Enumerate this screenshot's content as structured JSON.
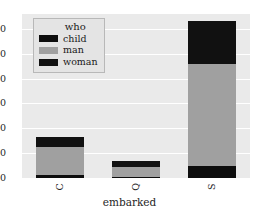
{
  "chart_data": {
    "type": "bar",
    "stacked": true,
    "title": "",
    "xlabel": "embarked",
    "ylabel": "",
    "categories": [
      "C",
      "Q",
      "S"
    ],
    "series": [
      {
        "name": "child",
        "color": "#0d0d0d",
        "values": [
          11,
          3,
          50
        ]
      },
      {
        "name": "man",
        "color": "#a0a0a0",
        "values": [
          115,
          40,
          410
        ]
      },
      {
        "name": "woman",
        "color": "#111111",
        "values": [
          38,
          25,
          170
        ]
      }
    ],
    "totals": [
      164,
      68,
      630
    ],
    "ylim": [
      0,
      660
    ],
    "yticks": [
      0,
      100,
      200,
      300,
      400,
      500,
      600
    ],
    "ytick_labels": [
      "0",
      "100",
      "200",
      "300",
      "400",
      "500",
      "600"
    ],
    "grid": true,
    "legend": {
      "title": "who",
      "position": "upper-left",
      "entries": [
        {
          "label": "child",
          "color": "#0d0d0d"
        },
        {
          "label": "man",
          "color": "#a0a0a0"
        },
        {
          "label": "woman",
          "color": "#111111"
        }
      ]
    },
    "style": {
      "axes_facecolor": "#eaeaea",
      "figure_facecolor": "#ffffff",
      "gridline_color": "#ffffff",
      "text_color": "#262626"
    }
  }
}
